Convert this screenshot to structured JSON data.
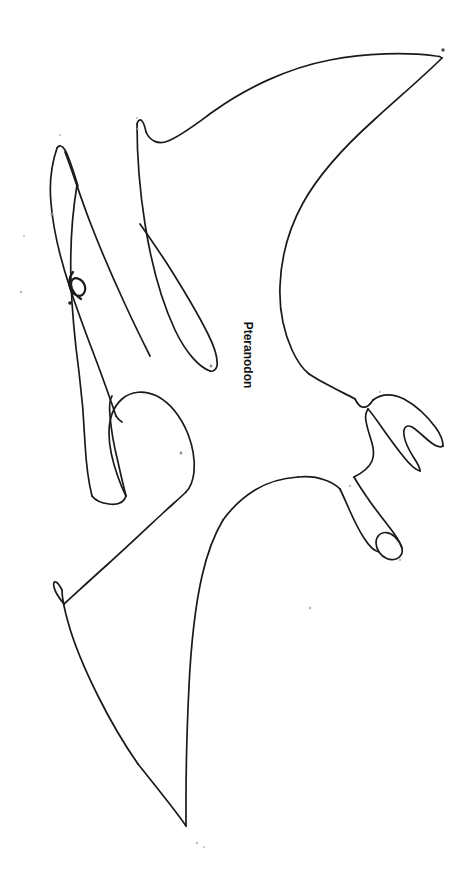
{
  "page": {
    "width": 474,
    "height": 881,
    "background_color": "#ffffff",
    "ink_color": "#1a1a1a",
    "stroke_width": 1.7
  },
  "artwork": {
    "subject": "pteranodon",
    "style": "black-and-white line drawing outline, coloring page",
    "orientation": "flying, head to upper-left, wings spread",
    "label": {
      "text": "Pteranodon",
      "rotation_degrees": 90,
      "bold": true,
      "font_size_px": 12,
      "color": "#111111",
      "center_x": 248,
      "center_y": 352
    },
    "parts": [
      {
        "name": "head-and-crest",
        "description": "long narrow beak with backswept crest pointing up-left"
      },
      {
        "name": "eye",
        "description": "small curled eye mark on the head"
      },
      {
        "name": "neck",
        "description": "slender neck joining head to body"
      },
      {
        "name": "upper-wing",
        "description": "large swept wing reaching the upper-right tip"
      },
      {
        "name": "upper-wing-finger",
        "description": "inner wing lobe with pointed tip below the crest"
      },
      {
        "name": "notch",
        "description": "small hook notch on the upper wing leading edge"
      },
      {
        "name": "body",
        "description": "torso tapering to the hips"
      },
      {
        "name": "upper-leg",
        "description": "rear leg with two-clawed foot pointing right"
      },
      {
        "name": "lower-leg",
        "description": "rear leg with looped clawed foot pointing down-right"
      },
      {
        "name": "lower-wing",
        "description": "lower wing sweeping down-left to a sharp tip"
      },
      {
        "name": "lower-wing-lobe",
        "description": "rounded inner lobe of the lower wing"
      }
    ],
    "specks": [
      {
        "x": 60,
        "y": 135,
        "r": 1.1
      },
      {
        "x": 137,
        "y": 118,
        "r": 1.1
      },
      {
        "x": 138,
        "y": 129,
        "r": 1.0
      },
      {
        "x": 52,
        "y": 214,
        "r": 1.6
      },
      {
        "x": 24,
        "y": 236,
        "r": 1.0
      },
      {
        "x": 21,
        "y": 292,
        "r": 1.3
      },
      {
        "x": 211,
        "y": 366,
        "r": 1.4
      },
      {
        "x": 181,
        "y": 453,
        "r": 1.4
      },
      {
        "x": 443,
        "y": 50,
        "r": 1.7
      },
      {
        "x": 350,
        "y": 486,
        "r": 1.2
      },
      {
        "x": 366,
        "y": 498,
        "r": 1.1
      },
      {
        "x": 310,
        "y": 608,
        "r": 1.4
      },
      {
        "x": 197,
        "y": 843,
        "r": 1.2
      },
      {
        "x": 204,
        "y": 847,
        "r": 1.0
      },
      {
        "x": 400,
        "y": 560,
        "r": 1.2
      },
      {
        "x": 380,
        "y": 392,
        "r": 1.1
      }
    ]
  }
}
